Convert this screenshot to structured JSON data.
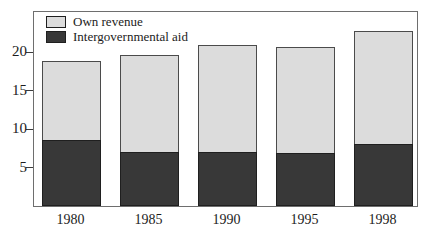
{
  "chart_data": {
    "type": "bar",
    "stacked": true,
    "title": "",
    "xlabel": "",
    "ylabel": "",
    "categories": [
      "1980",
      "1985",
      "1990",
      "1995",
      "1998"
    ],
    "series": [
      {
        "name": "Intergovernmental aid",
        "color": "#383838",
        "values": [
          8.6,
          7.0,
          7.0,
          6.9,
          8.0
        ]
      },
      {
        "name": "Own revenue",
        "color": "#dcdcdc",
        "values": [
          10.2,
          12.6,
          13.9,
          13.7,
          14.7
        ]
      }
    ],
    "totals": [
      18.8,
      19.6,
      20.9,
      20.6,
      22.7
    ],
    "yticks": [
      "5",
      "10",
      "15",
      "20"
    ],
    "ytick_values": [
      5,
      10,
      15,
      20
    ],
    "ylim": [
      0,
      25.2
    ],
    "grid": false,
    "legend_position": "inside-top-left",
    "legend_order_series_indexes": [
      1,
      0
    ]
  },
  "colors": {
    "background": "#ffffff",
    "frame": "#6e6e6e",
    "text": "#1c1c1c",
    "own_revenue_fill": "#dcdcdc",
    "aid_fill": "#383838"
  }
}
